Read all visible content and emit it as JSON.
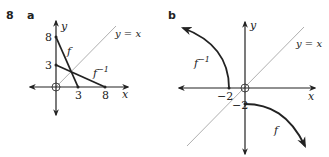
{
  "question": {
    "number": "8",
    "parts": [
      {
        "label": "a",
        "axis_x": "x",
        "axis_y": "y",
        "identity_line": "y = x",
        "curves": [
          {
            "name": "f",
            "label": "f",
            "points": [
              [
                0,
                8
              ],
              [
                3,
                0
              ]
            ]
          },
          {
            "name": "f_inverse",
            "label": "f",
            "superscript": "−1",
            "points": [
              [
                0,
                3
              ],
              [
                8,
                0
              ]
            ]
          }
        ],
        "ticks": {
          "x": [
            "3",
            "8"
          ],
          "y": [
            "8",
            "3"
          ]
        },
        "origin_marker": "circled-plus"
      },
      {
        "label": "b",
        "axis_x": "x",
        "axis_y": "y",
        "identity_line": "y = x",
        "curves": [
          {
            "name": "f",
            "label": "f",
            "start": [
              0,
              -2
            ],
            "direction": "down-right"
          },
          {
            "name": "f_inverse",
            "label": "f",
            "superscript": "−1",
            "start": [
              -2,
              0
            ],
            "direction": "up-left"
          }
        ],
        "ticks": {
          "x": [
            "−2"
          ],
          "y": [
            "−2"
          ]
        },
        "origin_marker": "circled-plus"
      }
    ]
  },
  "colors": {
    "ink": "#222222",
    "identity_line": "#9a9a9a",
    "background": "#ffffff"
  }
}
